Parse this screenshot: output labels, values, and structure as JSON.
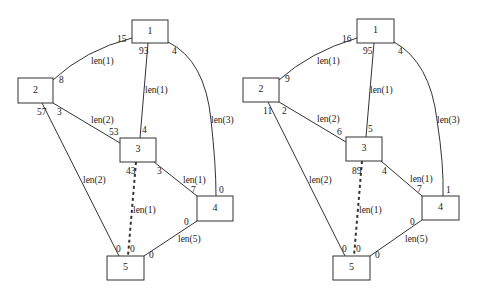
{
  "graphs": [
    {
      "name": "left",
      "nodes": [
        {
          "id": "1",
          "label": "1"
        },
        {
          "id": "2",
          "label": "2"
        },
        {
          "id": "3",
          "label": "3"
        },
        {
          "id": "4",
          "label": "4"
        },
        {
          "id": "5",
          "label": "5"
        }
      ],
      "edges": [
        {
          "from": "1",
          "to": "2",
          "label": "len(1)",
          "port_from": "15",
          "port_to": "8"
        },
        {
          "from": "1",
          "to": "3",
          "label": "len(1)",
          "port_from": "93",
          "port_to": "4"
        },
        {
          "from": "1",
          "to": "4",
          "label": "len(3)",
          "port_from": "4",
          "port_to": "0"
        },
        {
          "from": "2",
          "to": "3",
          "label": "len(2)",
          "port_from": "3",
          "port_to": "53"
        },
        {
          "from": "2",
          "to": "5",
          "label": "len(2)",
          "port_from": "57",
          "port_to": "0"
        },
        {
          "from": "3",
          "to": "4",
          "label": "len(1)",
          "port_from": "3",
          "port_to": "7"
        },
        {
          "from": "3",
          "to": "5",
          "label": "len(1)",
          "port_from": "43",
          "port_to": "0",
          "style": "dashed"
        },
        {
          "from": "4",
          "to": "5",
          "label": "len(5)",
          "port_from": "0",
          "port_to": "0"
        }
      ]
    },
    {
      "name": "right",
      "nodes": [
        {
          "id": "1",
          "label": "1"
        },
        {
          "id": "2",
          "label": "2"
        },
        {
          "id": "3",
          "label": "3"
        },
        {
          "id": "4",
          "label": "4"
        },
        {
          "id": "5",
          "label": "5"
        }
      ],
      "edges": [
        {
          "from": "1",
          "to": "2",
          "label": "len(1)",
          "port_from": "16",
          "port_to": "9"
        },
        {
          "from": "1",
          "to": "3",
          "label": "len(1)",
          "port_from": "95",
          "port_to": "5"
        },
        {
          "from": "1",
          "to": "4",
          "label": "len(3)",
          "port_from": "4",
          "port_to": "1"
        },
        {
          "from": "2",
          "to": "3",
          "label": "len(2)",
          "port_from": "2",
          "port_to": "6"
        },
        {
          "from": "2",
          "to": "5",
          "label": "len(2)",
          "port_from": "11",
          "port_to": "0"
        },
        {
          "from": "3",
          "to": "4",
          "label": "len(1)",
          "port_from": "4",
          "port_to": "7"
        },
        {
          "from": "3",
          "to": "5",
          "label": "len(1)",
          "port_from": "89",
          "port_to": "0",
          "style": "dashed"
        },
        {
          "from": "4",
          "to": "5",
          "label": "len(5)",
          "port_from": "0",
          "port_to": "0"
        }
      ]
    }
  ]
}
